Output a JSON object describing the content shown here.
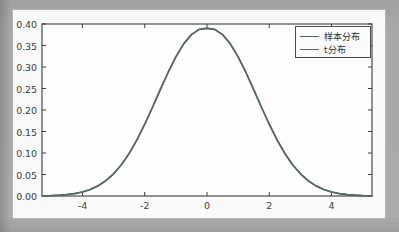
{
  "figure": {
    "background_color": "#a9a9a9",
    "card_color": "#fbfbfb",
    "axes_color": "#3a3a3a"
  },
  "legend": {
    "position": "upper right",
    "entries": [
      {
        "label": "样本分布",
        "color": "#4c5d6e"
      },
      {
        "label": "t分布",
        "color": "#5a6a5f"
      }
    ]
  },
  "axis": {
    "y_ticks": [
      "0.00",
      "0.05",
      "0.10",
      "0.15",
      "0.20",
      "0.25",
      "0.30",
      "0.35",
      "0.40"
    ],
    "x_ticks": [
      "-4",
      "-2",
      "0",
      "2",
      "4"
    ]
  },
  "chart_data": {
    "type": "line",
    "title": "",
    "xlabel": "",
    "ylabel": "",
    "xlim": [
      -5.3,
      5.3
    ],
    "ylim": [
      0.0,
      0.4
    ],
    "grid": false,
    "legend_position": "upper right",
    "x_ticks": [
      -4,
      -2,
      0,
      2,
      4
    ],
    "y_ticks": [
      0.0,
      0.05,
      0.1,
      0.15,
      0.2,
      0.25,
      0.3,
      0.35,
      0.4
    ],
    "x": [
      -5.3,
      -5.0,
      -4.75,
      -4.5,
      -4.25,
      -4.0,
      -3.75,
      -3.5,
      -3.25,
      -3.0,
      -2.75,
      -2.5,
      -2.25,
      -2.0,
      -1.75,
      -1.5,
      -1.25,
      -1.0,
      -0.75,
      -0.5,
      -0.25,
      0.0,
      0.25,
      0.5,
      0.75,
      1.0,
      1.25,
      1.5,
      1.75,
      2.0,
      2.25,
      2.5,
      2.75,
      3.0,
      3.25,
      3.5,
      3.75,
      4.0,
      4.25,
      4.5,
      4.75,
      5.0,
      5.3
    ],
    "series": [
      {
        "name": "样本分布",
        "color": "#4c5d6e",
        "values": [
          0.0003,
          0.0005,
          0.0009,
          0.0016,
          0.0027,
          0.0045,
          0.0073,
          0.0114,
          0.0172,
          0.025,
          0.0352,
          0.0479,
          0.0632,
          0.0807,
          0.0998,
          0.1196,
          0.1389,
          0.1565,
          0.1711,
          0.1815,
          0.1874,
          0.1886,
          0.1874,
          0.1815,
          0.1711,
          0.1565,
          0.1389,
          0.1196,
          0.0998,
          0.0807,
          0.0632,
          0.0479,
          0.0352,
          0.025,
          0.0172,
          0.0114,
          0.0073,
          0.0045,
          0.0027,
          0.0016,
          0.0009,
          0.0005,
          0.0003
        ]
      },
      {
        "name": "t分布",
        "color": "#5a6a5f",
        "values": [
          0.0003,
          0.0005,
          0.0009,
          0.0016,
          0.0027,
          0.0045,
          0.0073,
          0.0114,
          0.0172,
          0.025,
          0.0352,
          0.0479,
          0.0632,
          0.0807,
          0.0998,
          0.1196,
          0.1389,
          0.1565,
          0.1711,
          0.1815,
          0.1874,
          0.1886,
          0.1874,
          0.1815,
          0.1711,
          0.1565,
          0.1389,
          0.1196,
          0.0998,
          0.0807,
          0.0632,
          0.0479,
          0.0352,
          0.025,
          0.0172,
          0.0114,
          0.0073,
          0.0045,
          0.0027,
          0.0016,
          0.0009,
          0.0005,
          0.0003
        ]
      }
    ],
    "peak_value": 0.39,
    "peak_x": 0,
    "note": "两条曲线几乎完全重合 (standard normal density, peak ≈0.39 at x=0)"
  }
}
